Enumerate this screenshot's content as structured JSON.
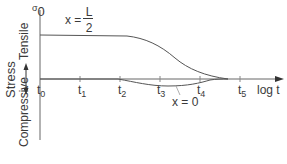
{
  "diagram": {
    "title": "",
    "y_axis": {
      "symbol": "σ",
      "symbol_subscript": "0",
      "label": "Stress",
      "positive_label": "Tensile",
      "negative_label": "Compressive"
    },
    "x_axis": {
      "label": "log t",
      "ticks": [
        {
          "name": "t",
          "sub": "0"
        },
        {
          "name": "t",
          "sub": "1"
        },
        {
          "name": "t",
          "sub": "2"
        },
        {
          "name": "t",
          "sub": "3"
        },
        {
          "name": "t",
          "sub": "4"
        },
        {
          "name": "t",
          "sub": "5"
        }
      ]
    },
    "curves": [
      {
        "id": "x-L-over-2",
        "label_prefix": "x =",
        "label_numerator": "L",
        "label_denominator": "2",
        "description": "Tensile stress constant until ~t2, then decays to zero near t5"
      },
      {
        "id": "x-0",
        "label": "x = 0",
        "description": "Zero until ~t2, slight compressive dip around t3, returns to zero near t5"
      }
    ],
    "colors": {
      "line": "#555555",
      "text": "#3a3a3a",
      "background": "#ffffff"
    }
  }
}
